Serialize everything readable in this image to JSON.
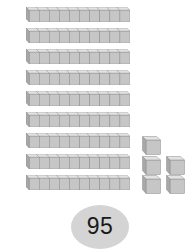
{
  "scene": {
    "title": "Base-ten blocks place value model",
    "background_color": "#ffffff",
    "total_label": "95"
  },
  "manipulative": {
    "type": "base-ten-blocks",
    "rod_label": "ten-rod",
    "unit_label": "unit-cube",
    "cubes_per_rod": 10,
    "rod_count": 9,
    "unit_count": 5,
    "tens_value": 90,
    "ones_value": 5,
    "total_value": 95
  },
  "rods": [
    {
      "index": 1,
      "top": 0,
      "cubes": 10
    },
    {
      "index": 2,
      "top": 21,
      "cubes": 10
    },
    {
      "index": 3,
      "top": 42,
      "cubes": 10
    },
    {
      "index": 4,
      "top": 63,
      "cubes": 10
    },
    {
      "index": 5,
      "top": 84,
      "cubes": 10
    },
    {
      "index": 6,
      "top": 105,
      "cubes": 10
    },
    {
      "index": 7,
      "top": 126,
      "cubes": 10
    },
    {
      "index": 8,
      "top": 147,
      "cubes": 10
    },
    {
      "index": 9,
      "top": 168,
      "cubes": 10
    }
  ],
  "units": [
    {
      "index": 1,
      "left": 0,
      "top": 0
    },
    {
      "index": 2,
      "left": 0,
      "top": 20
    },
    {
      "index": 3,
      "left": 24,
      "top": 20
    },
    {
      "index": 4,
      "left": 0,
      "top": 39
    },
    {
      "index": 5,
      "left": 24,
      "top": 39
    }
  ],
  "badge": {
    "name": "total-count-badge",
    "value": "95",
    "fill_color": "#d4d4d4",
    "text_color": "#1a1a1a"
  },
  "colors": {
    "block_top": "#e2e2e2",
    "block_front": "#c6c6c6",
    "block_side": "#a8a8a8",
    "block_outline": "#8c8c8c",
    "badge_fill": "#d4d4d4"
  }
}
